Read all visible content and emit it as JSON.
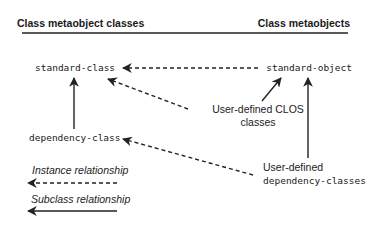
{
  "headers": {
    "left": "Class metaobject classes",
    "right": "Class metaobjects"
  },
  "nodes": {
    "standard_class": "standard-class",
    "standard_object": "standard-object",
    "dependency_class": "dependency-class"
  },
  "labels": {
    "user_clos_line1": "User-defined CLOS",
    "user_clos_line2": "classes",
    "user_dep_line1": "User-defined",
    "user_dep_line2": "dependency-classes"
  },
  "legend": {
    "instance": "Instance relationship",
    "subclass": "Subclass relationship"
  },
  "colors": {
    "ink": "#222222",
    "background": "#ffffff"
  }
}
